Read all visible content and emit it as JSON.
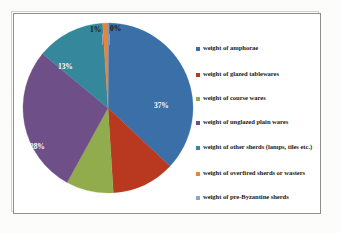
{
  "chart_data": {
    "type": "pie",
    "title": "",
    "subtitle": "",
    "xlabel": "",
    "ylabel": "",
    "grid": false,
    "legend_position": "right",
    "categories": [
      "weight of amphorae",
      "weight of glazed tablewares",
      "weight of course wares",
      "weight of unglazed plain wares",
      "weight of other sherds (lamps, tiles etc.)",
      "weight of overfired sherds or wasters",
      "weight of pre-Byzantine sherds"
    ],
    "values": [
      37,
      12,
      9,
      28,
      13,
      1,
      0
    ],
    "data_labels": [
      "37%",
      "12%",
      "9%",
      "28%",
      "13%",
      "1%",
      "0%"
    ],
    "colors": [
      "#3b6fa8",
      "#b8391f",
      "#91ac4d",
      "#6f4f87",
      "#35889b",
      "#e8833a",
      "#8ba8c9"
    ],
    "slices": [
      {
        "label": "weight of amphorae",
        "value": 37,
        "data_label": "37%",
        "color": "#3b6fa8"
      },
      {
        "label": "weight of glazed tablewares",
        "value": 12,
        "data_label": "12%",
        "color": "#b8391f"
      },
      {
        "label": "weight of course wares",
        "value": 9,
        "data_label": "9%",
        "color": "#91ac4d"
      },
      {
        "label": "weight of unglazed plain wares",
        "value": 28,
        "data_label": "28%",
        "color": "#6f4f87"
      },
      {
        "label": "weight of other sherds (lamps, tiles etc.)",
        "value": 13,
        "data_label": "13%",
        "color": "#35889b"
      },
      {
        "label": "weight of overfired sherds or wasters",
        "value": 1,
        "data_label": "1%",
        "color": "#e8833a"
      },
      {
        "label": "weight of pre-Byzantine sherds",
        "value": 0,
        "data_label": "0%",
        "color": "#8ba8c9"
      }
    ]
  },
  "legend": {
    "items": [
      {
        "label": "weight of amphorae",
        "color": "#3b6fa8"
      },
      {
        "label": "weight of glazed tablewares",
        "color": "#b8391f"
      },
      {
        "label": "weight of course wares",
        "color": "#91ac4d"
      },
      {
        "label": "weight of unglazed plain wares",
        "color": "#6f4f87"
      },
      {
        "label": "weight of other sherds (lamps, tiles etc.)",
        "color": "#35889b"
      },
      {
        "label": "weight of overfired sherds or wasters",
        "color": "#e8833a"
      },
      {
        "label": "weight of pre-Byzantine sherds",
        "color": "#8ba8c9"
      }
    ]
  },
  "labels": {
    "amphorae_pct": "37%",
    "glazed_pct": "12%",
    "course_pct": "9%",
    "unglazed_pct": "28%",
    "other_pct": "13%",
    "overfired_pct": "1%",
    "prebyzantine_pct": "0%"
  }
}
